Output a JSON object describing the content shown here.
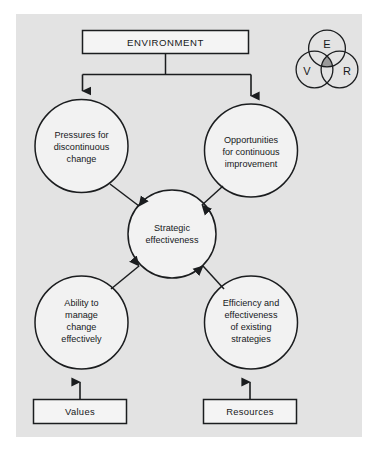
{
  "figure": {
    "name": "strategic-effectiveness-diagram",
    "panel": {
      "background_color": "#e3e3e3",
      "x": 16,
      "y": 14,
      "width": 346,
      "height": 423
    },
    "stroke_color": "#1b1d1f",
    "fill_color": "#f2f2f2"
  },
  "environment_box": {
    "label": "ENVIRONMENT"
  },
  "circles": {
    "pressures": {
      "lines": [
        "Pressures for",
        "discontinuous",
        "change"
      ]
    },
    "opportunities": {
      "lines": [
        "Opportunities",
        "for continuous",
        "improvement"
      ]
    },
    "center": {
      "lines": [
        "Strategic",
        "effectiveness"
      ]
    },
    "ability": {
      "lines": [
        "Ability to",
        "manage",
        "change",
        "effectively"
      ]
    },
    "efficiency": {
      "lines": [
        "Efficiency and",
        "effectiveness",
        "of existing",
        "strategies"
      ]
    }
  },
  "bottom_boxes": {
    "values": {
      "label": "Values"
    },
    "resources": {
      "label": "Resources"
    }
  },
  "venn": {
    "top": {
      "label": "E"
    },
    "left": {
      "label": "V"
    },
    "right": {
      "label": "R"
    },
    "intersection_color": "#9a9a9a"
  }
}
